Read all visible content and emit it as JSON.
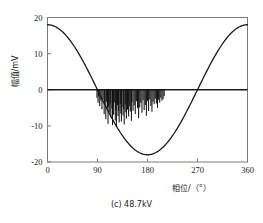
{
  "chart_data": {
    "type": "line",
    "title": "",
    "caption": "(c) 48.7kV",
    "xlabel": "相位/（°）",
    "ylabel": "幅值/mV",
    "xlim": [
      0,
      360
    ],
    "ylim": [
      -20,
      20
    ],
    "xticks": [
      0,
      90,
      180,
      270,
      360
    ],
    "xticklabels": [
      "0",
      "90",
      "180",
      "270",
      "360"
    ],
    "yticks": [
      -20,
      -10,
      0,
      10,
      20
    ],
    "yticklabels": [
      "-20",
      "-10",
      "0",
      "10",
      "20"
    ],
    "grid": false,
    "legend": "none",
    "zero_line": 0,
    "series": [
      {
        "name": "参考电压波形",
        "type": "line",
        "color": "#1a1a1a",
        "function": "cosine",
        "amplitude": 18,
        "phase_offset_deg": 0,
        "x": [
          0,
          10,
          20,
          30,
          40,
          50,
          60,
          70,
          80,
          90,
          100,
          110,
          120,
          130,
          140,
          150,
          160,
          170,
          180,
          190,
          200,
          210,
          220,
          230,
          240,
          250,
          260,
          270,
          280,
          290,
          300,
          310,
          320,
          330,
          340,
          350,
          360
        ],
        "values": [
          18.0,
          17.7,
          16.9,
          15.6,
          13.8,
          11.6,
          9.0,
          6.2,
          3.1,
          0.0,
          -3.1,
          -6.2,
          -9.0,
          -11.6,
          -13.8,
          -15.6,
          -16.9,
          -17.7,
          -18.0,
          -17.7,
          -16.9,
          -15.6,
          -13.8,
          -11.6,
          -9.0,
          -6.2,
          -3.1,
          0.0,
          3.1,
          6.2,
          9.0,
          11.6,
          13.8,
          15.6,
          16.9,
          17.7,
          18.0
        ]
      },
      {
        "name": "局部放电脉冲",
        "type": "stem",
        "color": "#111111",
        "phase_range_deg": [
          88,
          212
        ],
        "x": [
          89,
          91,
          92,
          94,
          96,
          98,
          100,
          102,
          103,
          105,
          106,
          108,
          109,
          110,
          112,
          113,
          114,
          116,
          117,
          118,
          119,
          121,
          122,
          123,
          124,
          126,
          127,
          128,
          129,
          131,
          132,
          133,
          134,
          136,
          137,
          138,
          140,
          141,
          142,
          144,
          145,
          146,
          148,
          149,
          151,
          152,
          154,
          156,
          158,
          160,
          162,
          164,
          166,
          168,
          170,
          172,
          174,
          176,
          178,
          180,
          182,
          184,
          186,
          188,
          190,
          192,
          194,
          196,
          198,
          200,
          202,
          204,
          206,
          208,
          210
        ],
        "values": [
          -2.2,
          -3.6,
          -1.9,
          -4.5,
          -3.0,
          -5.4,
          -2.6,
          -6.8,
          -4.1,
          -8.2,
          -3.3,
          -5.0,
          -9.4,
          -4.7,
          -6.3,
          -3.8,
          -7.6,
          -5.2,
          -9.8,
          -4.4,
          -6.9,
          -3.5,
          -8.5,
          -5.7,
          -10.2,
          -4.2,
          -7.3,
          -5.9,
          -9.1,
          -3.9,
          -6.6,
          -8.8,
          -4.8,
          -7.1,
          -5.3,
          -9.6,
          -4.0,
          -6.2,
          -8.0,
          -5.5,
          -3.7,
          -7.4,
          -4.6,
          -6.0,
          -8.6,
          -3.4,
          -5.8,
          -4.3,
          -6.7,
          -3.2,
          -5.1,
          -7.9,
          -4.9,
          -3.6,
          -6.4,
          -2.9,
          -5.6,
          -4.2,
          -7.2,
          -3.1,
          -5.9,
          -2.7,
          -4.5,
          -6.1,
          -3.3,
          -4.0,
          -2.5,
          -3.8,
          -5.0,
          -2.8,
          -3.5,
          -2.2,
          -3.0,
          -2.6,
          -1.8
        ]
      }
    ]
  }
}
